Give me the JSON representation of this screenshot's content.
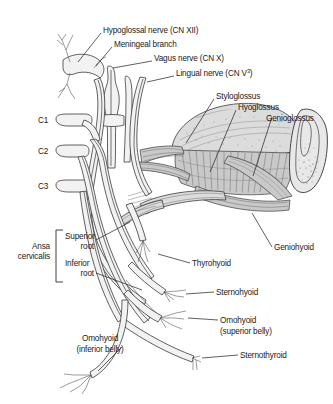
{
  "figure": {
    "background_color": "#ffffff",
    "line_color": "#2b2b2b",
    "muscle_color": "#dcdcdc",
    "bone_color": "#e8e8e8"
  },
  "labels": {
    "hypoglossal_nerve": "Hypoglossal nerve (CN XII)",
    "meningeal_branch": "Meningeal branch",
    "vagus_nerve": "Vagus nerve (CN X)",
    "lingual_nerve_main": "Lingual nerve (CN V",
    "lingual_nerve_sup": "3",
    "lingual_nerve_close": ")",
    "styloglossus": "Styloglossus",
    "hyoglossus": "Hyoglossus",
    "genioglossus": "Genioglossus",
    "geniohyoid": "Geniohyoid",
    "c1": "C1",
    "c2": "C2",
    "c3": "C3",
    "ansa_line1": "Ansa",
    "ansa_line2": "cervicalis",
    "superior_root_line1": "Superior",
    "superior_root_line2": "root",
    "inferior_root_line1": "Inferior",
    "inferior_root_line2": "root",
    "thyrohyoid": "Thyrohyoid",
    "sternohyoid": "Sternohyoid",
    "omohyoid_sup_line1": "Omohyoid",
    "omohyoid_sup_line2": "(superior belly)",
    "omohyoid_inf_line1": "Omohyoid",
    "omohyoid_inf_line2": "(inferior belly)",
    "sternothyroid": "Sternothyroid"
  }
}
